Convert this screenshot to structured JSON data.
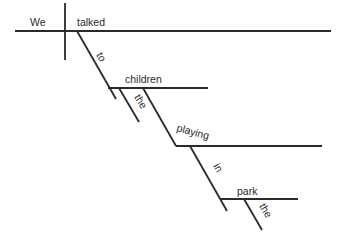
{
  "diagram": {
    "type": "sentence-diagram",
    "sentence": "We talked to the children playing in the park",
    "words": {
      "subject": "We",
      "verb": "talked",
      "preposition_1": "to",
      "object_1": "children",
      "article_1": "the",
      "participle": "playing",
      "preposition_2": "in",
      "object_2": "park",
      "article_2": "the"
    },
    "line_color": "#2a2a2a"
  }
}
